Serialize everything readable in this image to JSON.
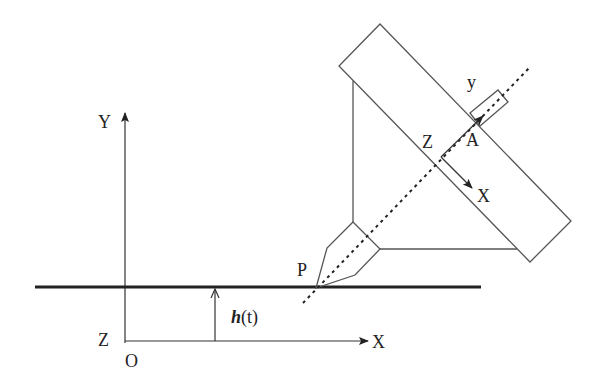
{
  "diagram": {
    "type": "technical-schematic",
    "global_axes": {
      "y_label": "Y",
      "x_label": "X",
      "z_label": "Z",
      "origin_label": "O"
    },
    "surface": {
      "height_label_func": "h",
      "height_label_arg": "(t)"
    },
    "tool": {
      "tip_label": "P"
    },
    "local_axes": {
      "origin_label": "A",
      "z_label": "Z",
      "x_label": "X",
      "y_label": "y"
    },
    "colors": {
      "line": "#555555",
      "thick_line": "#222222",
      "background": "#ffffff"
    }
  }
}
